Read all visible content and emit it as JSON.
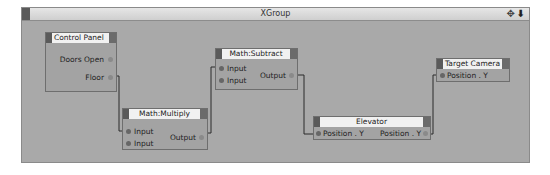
{
  "window": {
    "title": "XGroup",
    "icons": [
      "move-icon",
      "arrow-down-icon"
    ]
  },
  "nodes": [
    {
      "id": "control_panel",
      "title": "Control Panel",
      "inputs": [],
      "outputs": [
        "Doors Open",
        "Floor"
      ]
    },
    {
      "id": "math_multiply",
      "title": "Math:Multiply",
      "inputs": [
        "Input",
        "Input"
      ],
      "outputs": [
        "Output"
      ]
    },
    {
      "id": "math_subtract",
      "title": "Math:Subtract",
      "inputs": [
        "Input",
        "Input"
      ],
      "outputs": [
        "Output"
      ]
    },
    {
      "id": "elevator",
      "title": "Elevator",
      "inputs": [
        "Position . Y"
      ],
      "outputs": [
        "Position . Y"
      ]
    },
    {
      "id": "target_camera",
      "title": "Target Camera",
      "inputs": [
        "Position . Y"
      ],
      "outputs": []
    }
  ],
  "connections": [
    {
      "from": "Control Panel.Floor",
      "to": "Math:Multiply.Input"
    },
    {
      "from": "Math:Multiply.Output",
      "to": "Math:Subtract.Input"
    },
    {
      "from": "Math:Subtract.Output",
      "to": "Elevator.Position . Y"
    },
    {
      "from": "Elevator.Position . Y",
      "to": "Target Camera.Position . Y"
    }
  ]
}
